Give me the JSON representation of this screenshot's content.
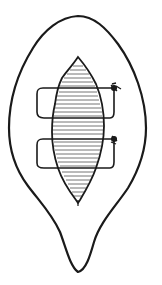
{
  "figure": {
    "type": "line-drawing",
    "subject": "wound closed with two horizontal mattress sutures",
    "colors": {
      "ink": "#1a1a1a",
      "background": "#ffffff"
    },
    "parts": {
      "outer_outline": "skin-excision-outline",
      "wound": "hatched-fusiform-wound",
      "sutures": [
        {
          "id": "suture-1",
          "knot_side": "right"
        },
        {
          "id": "suture-2",
          "knot_side": "right"
        }
      ]
    }
  }
}
